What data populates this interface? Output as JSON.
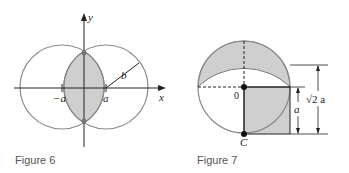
{
  "figures": [
    {
      "caption": "Figure 6",
      "labels": {
        "y_axis": "y",
        "x_axis": "x",
        "neg_a": "−a",
        "pos_a": "a",
        "radius": "b"
      },
      "colors": {
        "circle": "#8a8a8a",
        "shade": "#cfcfcf",
        "axis": "#222222"
      }
    },
    {
      "caption": "Figure 7",
      "labels": {
        "origin": "0",
        "bottom_point": "C",
        "side": "a",
        "height": "√2 a"
      },
      "colors": {
        "circle": "#8a8a8a",
        "shade": "#cfcfcf",
        "line": "#222222"
      }
    }
  ]
}
